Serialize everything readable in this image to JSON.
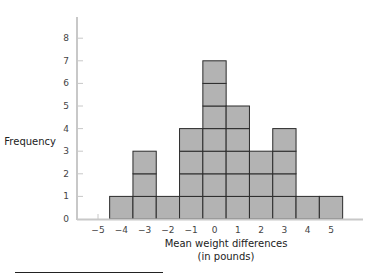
{
  "chart_data": {
    "type": "bar",
    "subtype": "histogram-stacked-squares",
    "title": "",
    "xlabel": "Mean weight differences",
    "xlabel_sub": "(in pounds)",
    "ylabel": "Frequency",
    "categories": [
      -4,
      -3,
      -2,
      -1,
      0,
      1,
      2,
      3,
      4,
      5
    ],
    "values": [
      1,
      3,
      1,
      4,
      7,
      5,
      3,
      4,
      1,
      1
    ],
    "x_ticks": [
      "−5",
      "−4",
      "−3",
      "−2",
      "−1",
      "0",
      "1",
      "2",
      "3",
      "4",
      "5"
    ],
    "y_ticks": [
      "0",
      "1",
      "2",
      "3",
      "4",
      "5",
      "6",
      "7",
      "8"
    ],
    "ylim": [
      0,
      8
    ],
    "grid": false,
    "legend": null,
    "colors": {
      "bar_fill": "#b3b3b3",
      "bar_stroke": "#2b2b2b",
      "axis": "#c8c8c8"
    }
  }
}
